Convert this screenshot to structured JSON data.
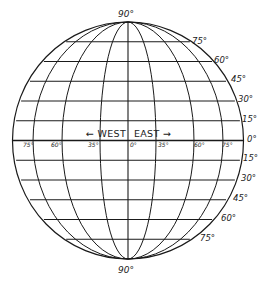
{
  "diagram": {
    "line_color": "#1a1a1a",
    "background": "#ffffff",
    "poles": {
      "north_label": "90°",
      "south_label": "90°"
    },
    "equator": {
      "west_label": "← WEST",
      "east_label": "EAST →"
    },
    "latitude_labels_north": [
      "75°",
      "60°",
      "45°",
      "30°",
      "15°"
    ],
    "equator_label": "0°",
    "latitude_labels_south": [
      "15°",
      "30°",
      "45°",
      "60°",
      "75°"
    ],
    "longitude_labels": [
      "75°",
      "60°",
      "35°",
      "0°",
      "35°",
      "60°",
      "75°"
    ]
  }
}
